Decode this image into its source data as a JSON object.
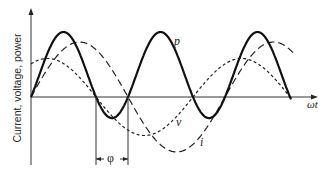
{
  "figure": {
    "y_axis_label": "Current, voltage, power",
    "x_axis_label": "ωt",
    "phase_label": "φ",
    "curve_labels": {
      "p": "p",
      "v": "v",
      "i": "i"
    }
  },
  "geometry": {
    "origin_x": 31,
    "origin_y": 97,
    "x_end": 318,
    "y_top": 8,
    "y_bottom": 165,
    "plot_end_x": 291,
    "period_px": 194,
    "v_amplitude": 38.5,
    "v_zero_descending_x": 96,
    "i_amplitude": 55,
    "phase_shift_px": 32,
    "p_peak_height": 65,
    "phase_marker": {
      "x1": 96,
      "x2": 128,
      "line_top": 105,
      "y": 159
    }
  },
  "styles": {
    "axis_color": "#333333",
    "p": {
      "stroke": "#111111",
      "width": 2.2,
      "dash": ""
    },
    "v": {
      "stroke": "#222222",
      "width": 1.2,
      "dash": "3,2.5"
    },
    "i": {
      "stroke": "#222222",
      "width": 1.2,
      "dash": "7,4"
    }
  }
}
